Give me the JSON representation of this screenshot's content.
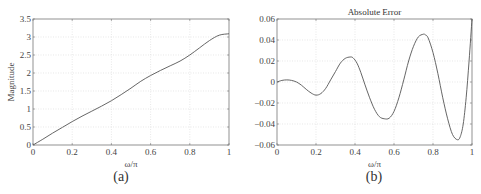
{
  "chart_data": [
    {
      "id": "a",
      "type": "line",
      "title": "",
      "caption": "(a)",
      "xlabel": "ω/π",
      "ylabel": "Magnitude",
      "xlim": [
        0,
        1
      ],
      "ylim": [
        0,
        3.5
      ],
      "xticks": [
        0,
        0.2,
        0.4,
        0.6,
        0.8,
        1
      ],
      "xtick_labels": [
        "0",
        "0.2",
        "0.4",
        "0.6",
        "0.8",
        "1"
      ],
      "yticks": [
        0,
        0.5,
        1,
        1.5,
        2,
        2.5,
        3,
        3.5
      ],
      "ytick_labels": [
        "0",
        "0.5",
        "1",
        "1.5",
        "2",
        "2.5",
        "3",
        "3.5"
      ],
      "grid": true,
      "series": [
        {
          "name": "Magnitude",
          "x": [
            0,
            0.05,
            0.1,
            0.15,
            0.2,
            0.25,
            0.3,
            0.35,
            0.4,
            0.45,
            0.5,
            0.55,
            0.6,
            0.65,
            0.7,
            0.75,
            0.8,
            0.85,
            0.9,
            0.95,
            1.0
          ],
          "y": [
            0,
            0.16,
            0.33,
            0.49,
            0.65,
            0.8,
            0.94,
            1.08,
            1.23,
            1.4,
            1.58,
            1.77,
            1.93,
            2.07,
            2.2,
            2.33,
            2.5,
            2.7,
            2.9,
            3.05,
            3.09
          ]
        }
      ]
    },
    {
      "id": "b",
      "type": "line",
      "title": "Absolute Error",
      "caption": "(b)",
      "xlabel": "ω/π",
      "ylabel": "",
      "xlim": [
        0,
        1
      ],
      "ylim": [
        -0.06,
        0.06
      ],
      "xticks": [
        0,
        0.2,
        0.4,
        0.6,
        0.8,
        1
      ],
      "xtick_labels": [
        "0",
        "0.2",
        "0.4",
        "0.6",
        "0.8",
        "1"
      ],
      "yticks": [
        -0.06,
        -0.04,
        -0.02,
        0,
        0.02,
        0.04,
        0.06
      ],
      "ytick_labels": [
        "−0.06",
        "−0.04",
        "−0.02",
        "0",
        "0.02",
        "0.04",
        "0.06"
      ],
      "grid": true,
      "series": [
        {
          "name": "Absolute Error",
          "x": [
            0,
            0.025,
            0.05,
            0.075,
            0.1,
            0.125,
            0.15,
            0.175,
            0.2,
            0.225,
            0.25,
            0.275,
            0.3,
            0.325,
            0.35,
            0.375,
            0.39,
            0.41,
            0.43,
            0.45,
            0.475,
            0.5,
            0.525,
            0.55,
            0.575,
            0.6,
            0.625,
            0.65,
            0.675,
            0.7,
            0.725,
            0.75,
            0.76,
            0.775,
            0.8,
            0.825,
            0.85,
            0.875,
            0.9,
            0.925,
            0.94,
            0.955,
            0.97,
            0.985,
            1.0
          ],
          "y": [
            0,
            0.0015,
            0.002,
            0.0015,
            0,
            -0.003,
            -0.007,
            -0.0105,
            -0.0125,
            -0.011,
            -0.006,
            0.002,
            0.01,
            0.018,
            0.0225,
            0.0238,
            0.023,
            0.018,
            0.009,
            -0.002,
            -0.015,
            -0.026,
            -0.033,
            -0.035,
            -0.0345,
            -0.028,
            -0.015,
            0.002,
            0.02,
            0.034,
            0.043,
            0.0455,
            0.045,
            0.042,
            0.028,
            0.008,
            -0.015,
            -0.035,
            -0.05,
            -0.055,
            -0.052,
            -0.04,
            -0.015,
            0.02,
            0.06
          ]
        }
      ]
    }
  ]
}
